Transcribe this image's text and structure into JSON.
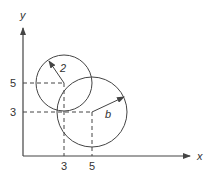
{
  "diagram": {
    "type": "geometry",
    "axes": {
      "x_label": "x",
      "y_label": "y",
      "x_ticks": [
        "3",
        "5"
      ],
      "y_ticks": [
        "5",
        "3"
      ]
    },
    "circles": [
      {
        "name": "small-circle",
        "center": [
          3,
          5
        ],
        "radius_label": "2"
      },
      {
        "name": "large-circle",
        "center": [
          5,
          3
        ],
        "radius_label": "b"
      }
    ],
    "colors": {
      "stroke": "#444444",
      "text": "#333333",
      "background": "#ffffff"
    }
  }
}
